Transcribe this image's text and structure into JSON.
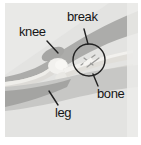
{
  "figure": {
    "kind": "annotated-xray-of-knee",
    "labels": {
      "knee": "knee",
      "break": "break",
      "bone": "bone",
      "leg": "leg"
    },
    "colors": {
      "page_background": "#ffffff",
      "photo_background": "#e3e3e1",
      "tissue_gray": "#acacaa",
      "tissue_gray_dark": "#a4a4a2",
      "tissue_gray_soft": "#c7c7c5",
      "bone_light": "#f2f1ee",
      "annotation_ink": "#222222",
      "label_text": "#161616"
    }
  }
}
